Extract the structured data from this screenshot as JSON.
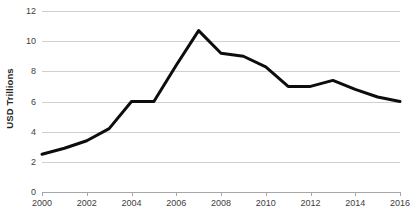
{
  "chart_data": {
    "type": "line",
    "title": "",
    "xlabel": "",
    "ylabel": "USD Trillions",
    "xlim": [
      2000,
      2016
    ],
    "ylim": [
      0,
      12
    ],
    "grid": true,
    "legend": "none",
    "line_color": "#0d0d0d",
    "gridline_color": "#d0d0d0",
    "axis_color": "#a6a6a6",
    "x": [
      2000,
      2001,
      2002,
      2003,
      2004,
      2005,
      2006,
      2007,
      2008,
      2009,
      2010,
      2011,
      2012,
      2013,
      2014,
      2015,
      2016
    ],
    "values": [
      2.5,
      2.9,
      3.4,
      4.2,
      6.0,
      6.0,
      8.4,
      10.7,
      9.2,
      9.0,
      8.3,
      7.0,
      7.0,
      7.4,
      6.8,
      6.3,
      6.0
    ],
    "x_tick_labels": [
      "2000",
      "2002",
      "2004",
      "2006",
      "2008",
      "2010",
      "2012",
      "2014",
      "2016"
    ],
    "x_tick_values": [
      2000,
      2002,
      2004,
      2006,
      2008,
      2010,
      2012,
      2014,
      2016
    ],
    "y_tick_labels": [
      "0",
      "2",
      "4",
      "6",
      "8",
      "10",
      "12"
    ],
    "y_tick_values": [
      0,
      2,
      4,
      6,
      8,
      10,
      12
    ]
  }
}
